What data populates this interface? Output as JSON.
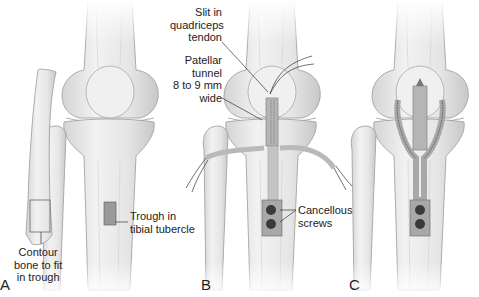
{
  "figure": {
    "panels": [
      {
        "id": "A",
        "letter": "A"
      },
      {
        "id": "B",
        "letter": "B"
      },
      {
        "id": "C",
        "letter": "C"
      }
    ],
    "labels": {
      "contour": [
        "Contour",
        "bone to fit",
        "in trough"
      ],
      "trough": [
        "Trough in",
        "tibial tubercle"
      ],
      "slit": [
        "Slit in",
        "quadriceps",
        "tendon"
      ],
      "tunnel": [
        "Patellar",
        "tunnel",
        "8 to 9 mm",
        "wide"
      ],
      "screws": [
        "Cancellous",
        "screws"
      ]
    },
    "colors": {
      "bone_fill": "#ececec",
      "bone_shade": "#c9c9c9",
      "outline": "#8a8a8a",
      "graft": "#b8b8b8",
      "trough": "#9a9a9a",
      "screw": "#3a3a3a",
      "text": "#222222"
    }
  }
}
